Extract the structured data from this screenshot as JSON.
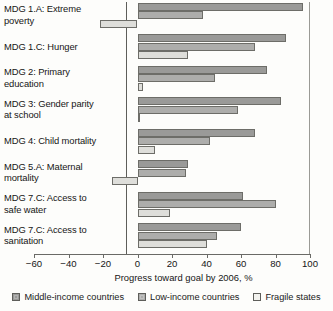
{
  "chart_data": {
    "type": "bar",
    "orientation": "horizontal",
    "grouped": true,
    "title": "",
    "xlabel": "Progress toward goal by 2006, %",
    "ylabel": "",
    "xlim": [
      -60,
      100
    ],
    "xticks": [
      -60,
      -40,
      -20,
      0,
      20,
      40,
      60,
      80,
      100
    ],
    "xtick_labels": [
      "−60",
      "−40",
      "−20",
      "0",
      "20",
      "40",
      "60",
      "80",
      "100"
    ],
    "grid": false,
    "legend_position": "bottom",
    "categories": [
      "MDG 1.A: Extreme poverty",
      "MDG 1.C: Hunger",
      "MDG 2: Primary education",
      "MDG 3: Gender parity at school",
      "MDG 4: Child mortality",
      "MDG 5.A: Maternal mortality",
      "MDG 7.C: Access to safe water",
      "MDG 7.C: Access to sanitation"
    ],
    "category_lines": [
      [
        "MDG 1.A: Extreme",
        "poverty"
      ],
      [
        "MDG 1.C: Hunger"
      ],
      [
        "MDG 2: Primary",
        "education"
      ],
      [
        "MDG 3: Gender parity",
        "at school"
      ],
      [
        "MDG 4: Child mortality"
      ],
      [
        "MDG 5.A: Maternal",
        "mortality"
      ],
      [
        "MDG 7.C: Access to",
        "safe water"
      ],
      [
        "MDG 7.C: Access to",
        "sanitation"
      ]
    ],
    "series": [
      {
        "name": "Middle-income countries",
        "color": "#9a9a98",
        "values": [
          96,
          86,
          75,
          83,
          68,
          29,
          61,
          60
        ]
      },
      {
        "name": "Low-income countries",
        "color": "#adadab",
        "values": [
          38,
          68,
          45,
          58,
          42,
          28,
          80,
          46
        ]
      },
      {
        "name": "Fragile states",
        "color": "#dededa",
        "values": [
          -22,
          29,
          3,
          1,
          10,
          -15,
          19,
          40
        ]
      }
    ]
  },
  "legend": {
    "items": [
      {
        "label": "Middle-income countries"
      },
      {
        "label": "Low-income countries"
      },
      {
        "label": "Fragile states"
      }
    ]
  }
}
